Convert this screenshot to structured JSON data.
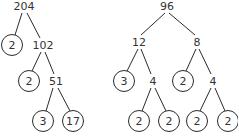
{
  "trees": [
    {
      "name": "factor-tree-204",
      "root": "204",
      "nodes": [
        {
          "id": "n0",
          "label": "204",
          "x": 24,
          "y": 6,
          "prime": false
        },
        {
          "id": "n1",
          "label": "2",
          "x": 12,
          "y": 45,
          "prime": true
        },
        {
          "id": "n2",
          "label": "102",
          "x": 43,
          "y": 45,
          "prime": false
        },
        {
          "id": "n3",
          "label": "2",
          "x": 29,
          "y": 81,
          "prime": true
        },
        {
          "id": "n4",
          "label": "51",
          "x": 56,
          "y": 81,
          "prime": false
        },
        {
          "id": "n5",
          "label": "3",
          "x": 43,
          "y": 121,
          "prime": true
        },
        {
          "id": "n6",
          "label": "17",
          "x": 73,
          "y": 121,
          "prime": true
        }
      ],
      "edges": [
        {
          "from": [
            22,
            13
          ],
          "to": [
            15,
            35
          ]
        },
        {
          "from": [
            27,
            13
          ],
          "to": [
            40,
            38
          ]
        },
        {
          "from": [
            41,
            52
          ],
          "to": [
            32,
            71
          ]
        },
        {
          "from": [
            45,
            52
          ],
          "to": [
            54,
            74
          ]
        },
        {
          "from": [
            53,
            88
          ],
          "to": [
            46,
            111
          ]
        },
        {
          "from": [
            58,
            88
          ],
          "to": [
            70,
            111
          ]
        }
      ]
    },
    {
      "name": "factor-tree-96",
      "root": "96",
      "nodes": [
        {
          "id": "m0",
          "label": "96",
          "x": 167,
          "y": 6,
          "prime": false
        },
        {
          "id": "m1",
          "label": "12",
          "x": 139,
          "y": 42,
          "prime": false
        },
        {
          "id": "m2",
          "label": "8",
          "x": 197,
          "y": 42,
          "prime": false
        },
        {
          "id": "m3",
          "label": "3",
          "x": 124,
          "y": 81,
          "prime": true
        },
        {
          "id": "m4",
          "label": "4",
          "x": 153,
          "y": 81,
          "prime": false
        },
        {
          "id": "m5",
          "label": "2",
          "x": 183,
          "y": 81,
          "prime": true
        },
        {
          "id": "m6",
          "label": "4",
          "x": 213,
          "y": 81,
          "prime": false
        },
        {
          "id": "m7",
          "label": "2",
          "x": 139,
          "y": 121,
          "prime": true
        },
        {
          "id": "m8",
          "label": "2",
          "x": 169,
          "y": 121,
          "prime": true
        },
        {
          "id": "m9",
          "label": "2",
          "x": 197,
          "y": 121,
          "prime": true
        },
        {
          "id": "m10",
          "label": "2",
          "x": 228,
          "y": 121,
          "prime": true
        }
      ],
      "edges": [
        {
          "from": [
            165,
            13
          ],
          "to": [
            141,
            35
          ]
        },
        {
          "from": [
            169,
            13
          ],
          "to": [
            195,
            35
          ]
        },
        {
          "from": [
            138,
            49
          ],
          "to": [
            127,
            71
          ]
        },
        {
          "from": [
            141,
            49
          ],
          "to": [
            151,
            74
          ]
        },
        {
          "from": [
            196,
            49
          ],
          "to": [
            186,
            71
          ]
        },
        {
          "from": [
            199,
            49
          ],
          "to": [
            211,
            74
          ]
        },
        {
          "from": [
            151,
            88
          ],
          "to": [
            142,
            111
          ]
        },
        {
          "from": [
            155,
            88
          ],
          "to": [
            166,
            111
          ]
        },
        {
          "from": [
            211,
            88
          ],
          "to": [
            200,
            111
          ]
        },
        {
          "from": [
            215,
            88
          ],
          "to": [
            225,
            111
          ]
        }
      ]
    }
  ],
  "style": {
    "circle_radius": 10.5,
    "stroke": "#2a2a2a",
    "text": "#333333"
  }
}
